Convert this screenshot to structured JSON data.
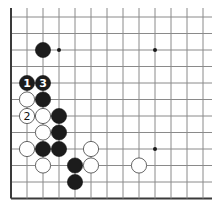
{
  "diagram": {
    "type": "go-board-fragment",
    "grid": {
      "columns": 13,
      "rows": 12,
      "origin_x": 11,
      "origin_y": 17,
      "spacing_x": 16,
      "spacing_y": 16.5,
      "extends_right": true,
      "extends_top": true,
      "left_edge": true,
      "bottom_edge": true
    },
    "star_points": [
      {
        "col": 3,
        "row": 2
      },
      {
        "col": 9,
        "row": 2
      },
      {
        "col": 9,
        "row": 8
      }
    ],
    "stones": [
      {
        "color": "black",
        "col": 2,
        "row": 2,
        "label": ""
      },
      {
        "color": "black",
        "col": 1,
        "row": 4,
        "label": "1"
      },
      {
        "color": "black",
        "col": 2,
        "row": 4,
        "label": "3"
      },
      {
        "color": "white",
        "col": 1,
        "row": 5,
        "label": ""
      },
      {
        "color": "black",
        "col": 2,
        "row": 5,
        "label": ""
      },
      {
        "color": "white",
        "col": 1,
        "row": 6,
        "label": "2"
      },
      {
        "color": "white",
        "col": 2,
        "row": 6,
        "label": ""
      },
      {
        "color": "black",
        "col": 3,
        "row": 6,
        "label": ""
      },
      {
        "color": "white",
        "col": 2,
        "row": 7,
        "label": ""
      },
      {
        "color": "black",
        "col": 3,
        "row": 7,
        "label": ""
      },
      {
        "color": "white",
        "col": 1,
        "row": 8,
        "label": ""
      },
      {
        "color": "black",
        "col": 2,
        "row": 8,
        "label": ""
      },
      {
        "color": "black",
        "col": 3,
        "row": 8,
        "label": ""
      },
      {
        "color": "white",
        "col": 5,
        "row": 8,
        "label": ""
      },
      {
        "color": "white",
        "col": 2,
        "row": 9,
        "label": ""
      },
      {
        "color": "black",
        "col": 4,
        "row": 9,
        "label": ""
      },
      {
        "color": "white",
        "col": 5,
        "row": 9,
        "label": ""
      },
      {
        "color": "white",
        "col": 8,
        "row": 9,
        "label": ""
      },
      {
        "color": "black",
        "col": 4,
        "row": 10,
        "label": ""
      }
    ],
    "move_labels": [
      "1",
      "2",
      "3"
    ],
    "colors": {
      "grid": "#8a8a8a",
      "edge": "#3a3a3a",
      "black_stone": "#1c1c1c",
      "white_stone": "#ffffff"
    }
  }
}
